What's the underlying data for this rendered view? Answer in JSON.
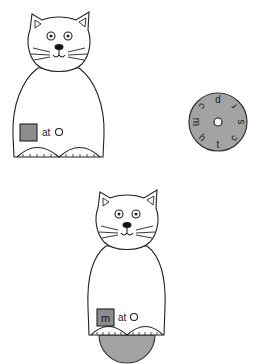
{
  "worksheet": {
    "cat_top": {
      "label_text": "at",
      "square_letter": "",
      "square_color": "#8c8c8c"
    },
    "wheel": {
      "color": "#a3a3a3",
      "letters": [
        "p",
        "r",
        "s",
        "c",
        "t",
        "h",
        "m",
        "c"
      ]
    },
    "cat_bottom": {
      "label_text": "at",
      "square_letter": "m",
      "square_color": "#8c8c8c",
      "wheel_peek_color": "#a3a3a3"
    }
  }
}
